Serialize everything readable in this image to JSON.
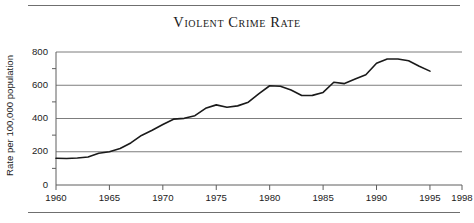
{
  "figure": {
    "title": "Violent Crime Rate",
    "rule_color": "#6f6f6f"
  },
  "chart_data": {
    "type": "line",
    "title": "Violent Crime Rate",
    "xlabel": "",
    "ylabel": "Rate per 100,000 population",
    "xlim": [
      1960,
      1998
    ],
    "ylim": [
      0,
      800
    ],
    "xticks": [
      1960,
      1965,
      1970,
      1975,
      1980,
      1985,
      1990,
      1995,
      1998
    ],
    "xtick_labels": [
      "1960",
      "1965",
      "1970",
      "1975",
      "1980",
      "1985",
      "1990",
      "1995",
      "1998"
    ],
    "yticks": [
      0,
      200,
      400,
      600,
      800
    ],
    "ytick_labels": [
      "0",
      "200",
      "400",
      "600",
      "800"
    ],
    "yminor_ticks": [
      100,
      300,
      500,
      700
    ],
    "grid": "horizontal",
    "legend": "none",
    "line_color": "#1a1a1a",
    "line_width": 1.6,
    "series": [
      {
        "name": "Violent crime rate",
        "x": [
          1960,
          1961,
          1962,
          1963,
          1964,
          1965,
          1966,
          1967,
          1968,
          1969,
          1970,
          1971,
          1972,
          1973,
          1974,
          1975,
          1976,
          1977,
          1978,
          1979,
          1980,
          1981,
          1982,
          1983,
          1984,
          1985,
          1986,
          1987,
          1988,
          1989,
          1990,
          1991,
          1992,
          1993,
          1994,
          1995
        ],
        "y": [
          161,
          159,
          162,
          168,
          191,
          200,
          220,
          253,
          298,
          329,
          364,
          396,
          401,
          417,
          461,
          482,
          468,
          476,
          498,
          549,
          597,
          594,
          571,
          538,
          539,
          557,
          618,
          610,
          637,
          663,
          732,
          758,
          758,
          747,
          714,
          685
        ]
      }
    ]
  }
}
